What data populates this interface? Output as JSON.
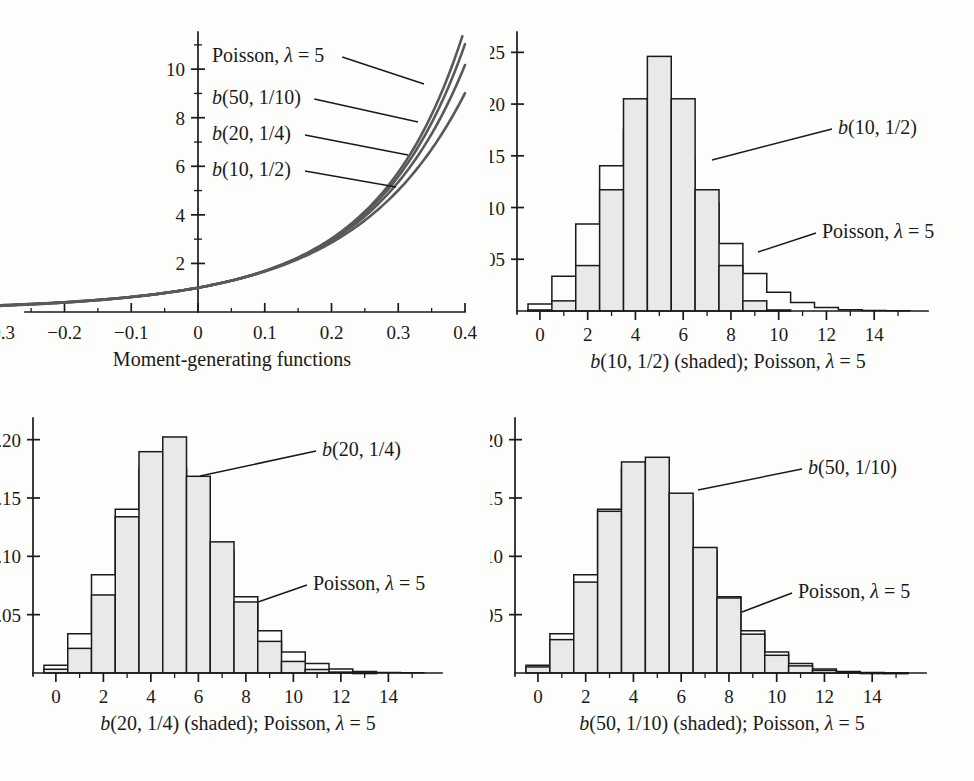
{
  "figure": {
    "colors": {
      "bar_fill": "#e9e9e7",
      "outline": "#1a1a1a",
      "curve": "#595959",
      "background": "#fdfdfc"
    }
  },
  "panels": {
    "mgf": {
      "caption": "Moment-generating functions",
      "labels": [
        {
          "text": "Poisson, λ = 5",
          "html": "Poisson, λ = 5"
        },
        {
          "text": "b(50, 1/10)",
          "html": "b(50, 1/10)"
        },
        {
          "text": "b(20, 1/4)",
          "html": "b(20, 1/4)"
        },
        {
          "text": "b(10, 1/2)",
          "html": "b(10, 1/2)"
        }
      ],
      "x_ticks": [
        "-0.4",
        "-0.3",
        "-0.2",
        "-0.1",
        "0",
        "0.1",
        "0.2",
        "0.3",
        "0.4"
      ],
      "y_ticks": [
        "2",
        "4",
        "6",
        "8",
        "10"
      ]
    },
    "b10": {
      "caption": "b(10, 1/2) (shaded); Poisson, λ = 5",
      "label_binomial": "b(10, 1/2)",
      "label_poisson": "Poisson, λ = 5",
      "x_ticks": [
        "0",
        "2",
        "4",
        "6",
        "8",
        "10",
        "12",
        "14"
      ],
      "y_ticks": [
        "0.05",
        "0.10",
        "0.15",
        "0.20",
        "0.25"
      ]
    },
    "b20": {
      "caption": "b(20, 1/4) (shaded); Poisson, λ = 5",
      "label_binomial": "b(20, 1/4)",
      "label_poisson": "Poisson, λ = 5",
      "x_ticks": [
        "0",
        "2",
        "4",
        "6",
        "8",
        "10",
        "12",
        "14"
      ],
      "y_ticks": [
        "0.05",
        "0.10",
        "0.15",
        "0.20"
      ]
    },
    "b50": {
      "caption": "b(50, 1/10) (shaded); Poisson, λ = 5",
      "label_binomial": "b(50, 1/10)",
      "label_poisson": "Poisson, λ = 5",
      "x_ticks": [
        "0",
        "2",
        "4",
        "6",
        "8",
        "10",
        "12",
        "14"
      ],
      "y_ticks": [
        "0.05",
        "0.10",
        "0.15",
        "0.20"
      ]
    }
  },
  "chart_data": [
    {
      "id": "mgf",
      "type": "line",
      "title": "Moment-generating functions",
      "xlabel": "t",
      "ylabel": "M(t)",
      "xlim": [
        -0.4,
        0.4
      ],
      "ylim": [
        0,
        11.2
      ],
      "grid": false,
      "legend": "inline-labels",
      "x_ticks_major": [
        -0.4,
        -0.3,
        -0.2,
        -0.1,
        0,
        0.1,
        0.2,
        0.3,
        0.4
      ],
      "x_ticks_minor_step": 0.05,
      "y_ticks_major": [
        2,
        4,
        6,
        8,
        10
      ],
      "y_ticks_minor": [
        1,
        3,
        5,
        7,
        9,
        11
      ],
      "series": [
        {
          "name": "Poisson, λ = 5",
          "formula": "exp(5*(exp(t)-1))",
          "x": [
            -0.4,
            -0.3,
            -0.2,
            -0.1,
            0,
            0.1,
            0.2,
            0.3,
            0.35,
            0.4
          ],
          "values": [
            0.194,
            0.304,
            0.4,
            0.624,
            1.0,
            1.69,
            3.03,
            5.76,
            8.18,
            11.9
          ]
        },
        {
          "name": "b(50, 1/10)",
          "formula": "(0.9 + 0.1*exp(t))^50",
          "x": [
            -0.4,
            -0.3,
            -0.2,
            -0.1,
            0,
            0.1,
            0.2,
            0.3,
            0.35,
            0.4
          ],
          "values": [
            0.211,
            0.323,
            0.51,
            0.65,
            1.0,
            1.67,
            2.93,
            5.39,
            7.51,
            10.7
          ]
        },
        {
          "name": "b(20, 1/4)",
          "formula": "(0.75 + 0.25*exp(t))^20",
          "x": [
            -0.4,
            -0.3,
            -0.2,
            -0.1,
            0,
            0.1,
            0.2,
            0.3,
            0.35,
            0.4
          ],
          "values": [
            0.229,
            0.345,
            0.52,
            0.66,
            1.0,
            1.65,
            2.83,
            5.03,
            6.89,
            9.62
          ]
        },
        {
          "name": "b(10, 1/2)",
          "formula": "(0.5 + 0.5*exp(t))^10",
          "x": [
            -0.4,
            -0.3,
            -0.2,
            -0.1,
            0,
            0.1,
            0.2,
            0.3,
            0.35,
            0.4
          ],
          "values": [
            0.268,
            0.386,
            0.55,
            0.69,
            1.0,
            1.61,
            2.63,
            4.42,
            5.83,
            7.77
          ]
        }
      ]
    },
    {
      "id": "b10",
      "type": "bar",
      "title": "b(10, 1/2) (shaded); Poisson, λ = 5",
      "xlabel": "k",
      "ylabel": "probability",
      "xlim": [
        -0.5,
        15.5
      ],
      "ylim": [
        0,
        0.26
      ],
      "grid": false,
      "categories": [
        0,
        1,
        2,
        3,
        4,
        5,
        6,
        7,
        8,
        9,
        10,
        11,
        12,
        13,
        14,
        15
      ],
      "y_ticks_major": [
        0.05,
        0.1,
        0.15,
        0.2,
        0.25
      ],
      "series": [
        {
          "name": "b(10, 1/2)",
          "style": "shaded",
          "values": [
            0.001,
            0.0098,
            0.0439,
            0.1172,
            0.2051,
            0.2461,
            0.2051,
            0.1172,
            0.0439,
            0.0098,
            0.001,
            0,
            0,
            0,
            0,
            0
          ]
        },
        {
          "name": "Poisson, λ = 5",
          "style": "outline",
          "values": [
            0.0067,
            0.0337,
            0.0842,
            0.1404,
            0.1755,
            0.1755,
            0.1462,
            0.1044,
            0.0653,
            0.0363,
            0.0181,
            0.0082,
            0.0034,
            0.0013,
            0.0005,
            0.0002
          ]
        }
      ]
    },
    {
      "id": "b20",
      "type": "bar",
      "title": "b(20, 1/4) (shaded); Poisson, λ = 5",
      "xlabel": "k",
      "ylabel": "probability",
      "xlim": [
        -0.5,
        15.5
      ],
      "ylim": [
        0,
        0.21
      ],
      "grid": false,
      "categories": [
        0,
        1,
        2,
        3,
        4,
        5,
        6,
        7,
        8,
        9,
        10,
        11,
        12,
        13,
        14,
        15
      ],
      "y_ticks_major": [
        0.05,
        0.1,
        0.15,
        0.2
      ],
      "series": [
        {
          "name": "b(20, 1/4)",
          "style": "shaded",
          "values": [
            0.0032,
            0.0211,
            0.0669,
            0.1339,
            0.1897,
            0.2023,
            0.1686,
            0.1124,
            0.0609,
            0.0271,
            0.0099,
            0.003,
            0.0008,
            0.0002,
            0.0,
            0.0
          ]
        },
        {
          "name": "Poisson, λ = 5",
          "style": "outline",
          "values": [
            0.0067,
            0.0337,
            0.0842,
            0.1404,
            0.1755,
            0.1755,
            0.1462,
            0.1044,
            0.0653,
            0.0363,
            0.0181,
            0.0082,
            0.0034,
            0.0013,
            0.0005,
            0.0002
          ]
        }
      ]
    },
    {
      "id": "b50",
      "type": "bar",
      "title": "b(50, 1/10) (shaded); Poisson, λ = 5",
      "xlabel": "k",
      "ylabel": "probability",
      "xlim": [
        -0.5,
        15.5
      ],
      "ylim": [
        0,
        0.21
      ],
      "grid": false,
      "categories": [
        0,
        1,
        2,
        3,
        4,
        5,
        6,
        7,
        8,
        9,
        10,
        11,
        12,
        13,
        14,
        15
      ],
      "y_ticks_major": [
        0.05,
        0.1,
        0.15,
        0.2
      ],
      "series": [
        {
          "name": "b(50, 1/10)",
          "style": "shaded",
          "values": [
            0.0052,
            0.0286,
            0.0779,
            0.1386,
            0.1809,
            0.1849,
            0.1541,
            0.1076,
            0.0643,
            0.0333,
            0.0152,
            0.0061,
            0.0022,
            0.0007,
            0.0002,
            0.0001
          ]
        },
        {
          "name": "Poisson, λ = 5",
          "style": "outline",
          "values": [
            0.0067,
            0.0337,
            0.0842,
            0.1404,
            0.1755,
            0.1755,
            0.1462,
            0.1044,
            0.0653,
            0.0363,
            0.0181,
            0.0082,
            0.0034,
            0.0013,
            0.0005,
            0.0002
          ]
        }
      ]
    }
  ]
}
